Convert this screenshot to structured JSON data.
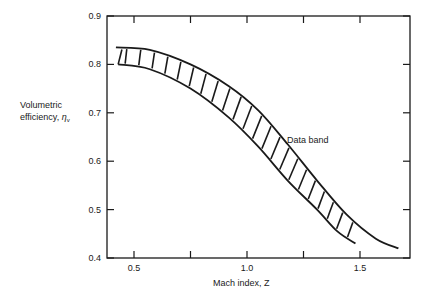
{
  "chart_data": {
    "type": "line",
    "title": "",
    "xlabel": "Mach index, Z",
    "ylabel_line1": "Volumetric",
    "ylabel_line2": "efficiency, ",
    "ylabel_symbol": "η",
    "ylabel_subscript": "v",
    "xlim": [
      0.38,
      1.72
    ],
    "ylim": [
      0.4,
      0.9
    ],
    "x_ticks": [
      0.5,
      0.75,
      1.0,
      1.25,
      1.5
    ],
    "x_tick_labels": [
      "0.5",
      "",
      "1.0",
      "",
      "1.5"
    ],
    "y_ticks": [
      0.4,
      0.5,
      0.6,
      0.7,
      0.8,
      0.9
    ],
    "y_tick_labels": [
      "0.4",
      "0.5",
      "0.6",
      "0.7",
      "0.8",
      "0.9"
    ],
    "grid": false,
    "legend": null,
    "annotation": "Data band",
    "series": [
      {
        "name": "Data band upper bound",
        "x": [
          0.42,
          0.57,
          0.75,
          0.92,
          1.05,
          1.18,
          1.31,
          1.44,
          1.57,
          1.67
        ],
        "y": [
          0.835,
          0.83,
          0.8,
          0.755,
          0.705,
          0.635,
          0.56,
          0.49,
          0.44,
          0.42
        ]
      },
      {
        "name": "Data band lower bound",
        "x": [
          0.43,
          0.57,
          0.75,
          0.92,
          1.05,
          1.18,
          1.31,
          1.4,
          1.48
        ],
        "y": [
          0.8,
          0.79,
          0.75,
          0.69,
          0.63,
          0.56,
          0.5,
          0.455,
          0.43
        ]
      }
    ],
    "hatch_count": 22,
    "colors": {
      "line": "#1a1a1a",
      "background": "#ffffff"
    }
  }
}
